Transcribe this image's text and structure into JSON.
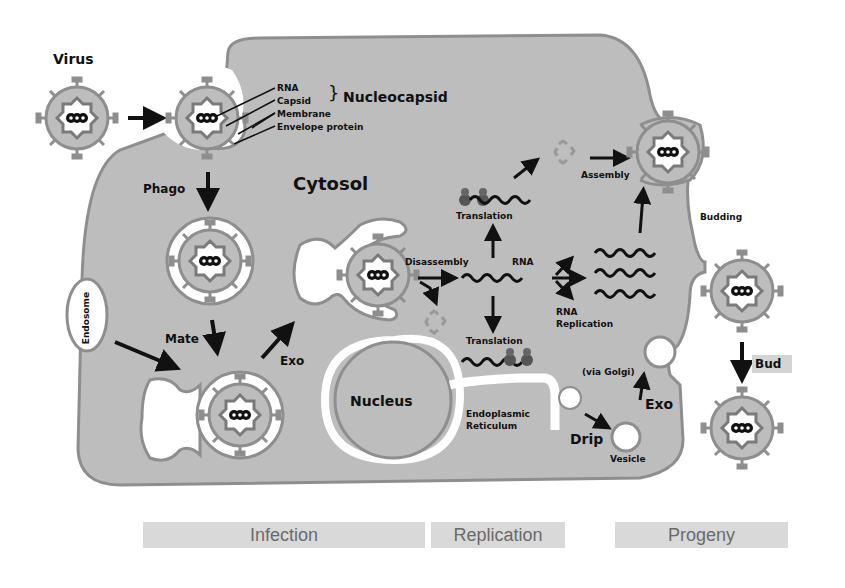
{
  "colors": {
    "cytoplasm": "#bdbdbd",
    "membrane": "#8e8e8e",
    "capsid": "#7a7a7a",
    "stage_bar": "#d9d9d9",
    "stage_text": "#6a6a6a",
    "text": "#111111"
  },
  "labels": {
    "virus": "Virus",
    "rna": "RNA",
    "capsid": "Capsid",
    "brace": "}",
    "nucleocapsid": "Nucleocapsid",
    "membrane": "Membrane",
    "envelope_protein": "Envelope protein",
    "phago": "Phago",
    "cytosol": "Cytosol",
    "endosome": "Endosome",
    "mate": "Mate",
    "exo_left": "Exo",
    "disassembly": "Disassembly",
    "rna_center": "RNA",
    "translation_top": "Translation",
    "translation_bottom": "Translation",
    "rna_replication": "RNA\nReplication",
    "rna_replication_line1": "RNA",
    "rna_replication_line2": "Replication",
    "assembly": "Assembly",
    "budding": "Budding",
    "bud": "Bud",
    "nucleus": "Nucleus",
    "endoplasmic_reticulum_line1": "Endoplasmic",
    "endoplasmic_reticulum_line2": "Reticulum",
    "drip": "Drip",
    "vesicle": "Vesicle",
    "via_golgi": "(via Golgi)",
    "exo_right": "Exo"
  },
  "stages": [
    {
      "label": "Infection"
    },
    {
      "label": "Replication"
    },
    {
      "label": "Progeny"
    }
  ]
}
